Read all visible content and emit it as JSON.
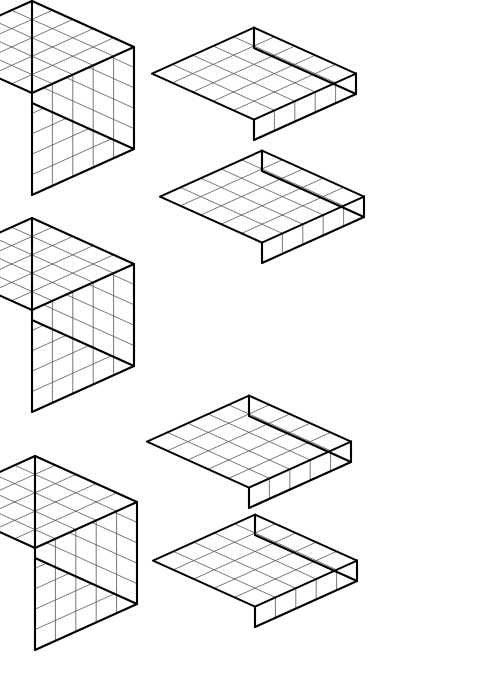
{
  "page": {
    "width": 483,
    "height": 679,
    "background_color": "#ffffff",
    "watermark": "MATH"
  },
  "style": {
    "outline_color": "#000000",
    "grid_line_color": "#555555",
    "face_fill_color": "#ffffff",
    "outline_width": 2.1,
    "grid_width": 0.8
  },
  "projection": {
    "unit_px": 20.4,
    "x_axis_dx": 20.4,
    "x_axis_dy": -9.2,
    "y_axis_dx": -20.4,
    "y_axis_dy": -9.2,
    "z_axis_dy": 20.4,
    "note": "oblique-isometric: top face is a rhombus, depth recedes up-left, width recedes up-right"
  },
  "shapes": [
    {
      "id": "cube-1",
      "name": "large-cube-top-left",
      "kind": "cube",
      "label": "5 x 5 x 5 cube",
      "cols": 5,
      "rows": 5,
      "layers": 5,
      "unit_count": 125,
      "origin_x": 32,
      "origin_y": 195
    },
    {
      "id": "slab-1",
      "name": "flat-slab-top-right",
      "kind": "slab",
      "label": "5 x 5 x 1 flat",
      "cols": 5,
      "rows": 5,
      "layers": 1,
      "unit_count": 25,
      "origin_x": 254,
      "origin_y": 140
    },
    {
      "id": "slab-2",
      "name": "flat-slab-upper-middle-right",
      "kind": "slab",
      "label": "5 x 5 x 1 flat",
      "cols": 5,
      "rows": 5,
      "layers": 1,
      "unit_count": 25,
      "origin_x": 262,
      "origin_y": 263
    },
    {
      "id": "cube-2",
      "name": "large-cube-middle-left",
      "kind": "cube",
      "label": "5 x 5 x 5 cube",
      "cols": 5,
      "rows": 5,
      "layers": 5,
      "unit_count": 125,
      "origin_x": 32,
      "origin_y": 412
    },
    {
      "id": "slab-3",
      "name": "flat-slab-lower-middle-right",
      "kind": "slab",
      "label": "5 x 5 x 1 flat",
      "cols": 5,
      "rows": 5,
      "layers": 1,
      "unit_count": 25,
      "origin_x": 249,
      "origin_y": 508
    },
    {
      "id": "cube-3",
      "name": "large-cube-bottom-left",
      "kind": "cube",
      "label": "5 x 5 x 5 cube",
      "cols": 5,
      "rows": 5,
      "layers": 5,
      "unit_count": 125,
      "origin_x": 35,
      "origin_y": 650
    },
    {
      "id": "slab-4",
      "name": "flat-slab-bottom-right",
      "kind": "slab",
      "label": "5 x 5 x 1 flat",
      "cols": 5,
      "rows": 5,
      "layers": 1,
      "unit_count": 25,
      "origin_x": 255,
      "origin_y": 627
    }
  ],
  "summary": {
    "cube_count": 3,
    "slab_count": 4,
    "total_shapes": 7
  }
}
